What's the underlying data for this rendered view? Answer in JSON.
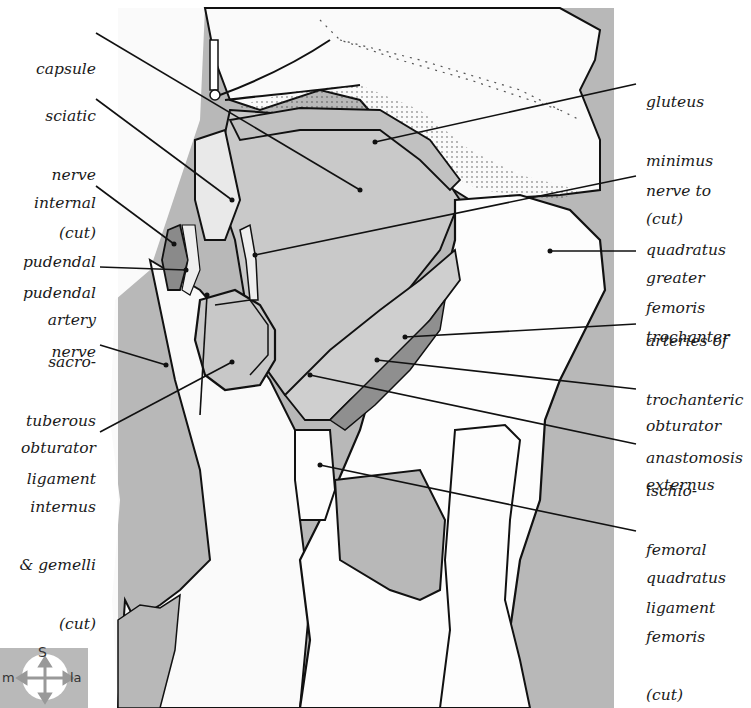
{
  "figure": {
    "colors": {
      "background_gray": "#b7b7b7",
      "muscle_gray": "#cfcfcf",
      "dark_vessel": "#8a8a8a",
      "outline": "#111111",
      "bone_white": "#fdfdfd"
    }
  },
  "labels_left": [
    {
      "id": "capsule",
      "lines": [
        "capsule"
      ]
    },
    {
      "id": "sciatic-nerve",
      "lines": [
        "sciatic",
        "nerve",
        "(cut)"
      ]
    },
    {
      "id": "internal-pudendal-artery",
      "lines": [
        "internal",
        "pudendal",
        "artery"
      ]
    },
    {
      "id": "pudendal-nerve",
      "lines": [
        "pudendal",
        "nerve"
      ]
    },
    {
      "id": "sacrotuberous-ligament",
      "lines": [
        "sacro-",
        "tuberous",
        "ligament"
      ]
    },
    {
      "id": "obturator-internus-gemelli",
      "lines": [
        "obturator",
        "internus",
        "& gemelli",
        "(cut)"
      ]
    }
  ],
  "labels_right": [
    {
      "id": "gluteus-minimus",
      "lines": [
        "gluteus",
        "minimus",
        "(cut)"
      ]
    },
    {
      "id": "nerve-to-quadratus-femoris",
      "lines": [
        "nerve to",
        "quadratus",
        "femoris"
      ]
    },
    {
      "id": "greater-trochanter",
      "lines": [
        "greater",
        "trochanter"
      ]
    },
    {
      "id": "arteries-trochanteric-anastomosis",
      "lines": [
        "arteries of",
        "trochanteric",
        "anastomosis"
      ]
    },
    {
      "id": "obturator-externus",
      "lines": [
        "obturator",
        "externus"
      ]
    },
    {
      "id": "ischiofemoral-ligament",
      "lines": [
        "ischio-",
        "femoral",
        "ligament"
      ]
    },
    {
      "id": "quadratus-femoris",
      "lines": [
        "quadratus",
        "femoris",
        "(cut)"
      ]
    }
  ],
  "compass": {
    "superior": "S",
    "medial": "m",
    "lateral": "la"
  }
}
